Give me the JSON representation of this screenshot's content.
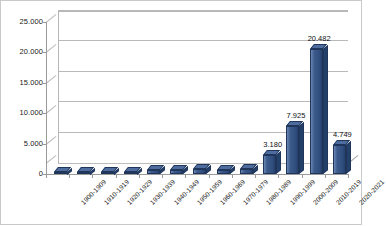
{
  "chart_data": {
    "type": "bar",
    "title": "",
    "subtitle": "",
    "xlabel": "",
    "ylabel": "",
    "grid": true,
    "legend": false,
    "legend_position": "none",
    "style": "3d-column",
    "bar_color": "#3c5b8c",
    "bar_color_top": "#4e6d9e",
    "bar_color_side": "#23406b",
    "ylim": [
      0,
      25000
    ],
    "yticks": [
      0,
      5000,
      10000,
      15000,
      20000,
      25000
    ],
    "ytick_labels": [
      "0",
      "5.000",
      "10.000",
      "15.000",
      "20.000",
      "25.000"
    ],
    "categories": [
      "1900-1909",
      "1910-1919",
      "1920-1929",
      "1930-1939",
      "1940-1949",
      "1950-1959",
      "1960-1969",
      "1970-1979",
      "1980-1989",
      "1990-1999",
      "2000-2009",
      "2010-2019",
      "2020-2021"
    ],
    "values": [
      90,
      130,
      95,
      330,
      640,
      720,
      780,
      700,
      790,
      3180,
      7925,
      20482,
      4749
    ],
    "data_labels": [
      "",
      "",
      "",
      "",
      "",
      "",
      "",
      "",
      "",
      "3.180",
      "7.925",
      "20.482",
      "4.749"
    ]
  }
}
